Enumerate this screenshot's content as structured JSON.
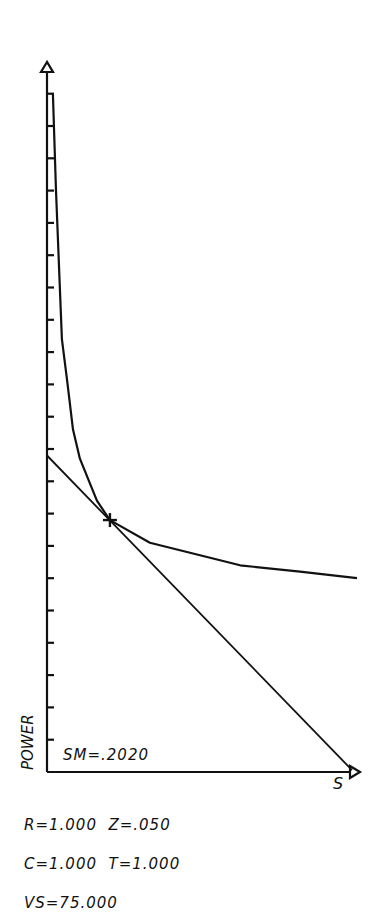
{
  "chart_data": {
    "type": "line",
    "title": "",
    "xlabel": "S",
    "ylabel": "POWER",
    "xlim": [
      0,
      1.0
    ],
    "ylim": [
      0,
      21
    ],
    "grid": false,
    "y_ticks_count": 21,
    "series": [
      {
        "name": "power-curve",
        "x": [
          0.019,
          0.029,
          0.048,
          0.065,
          0.084,
          0.106,
          0.161,
          0.203,
          0.332,
          0.623,
          0.816,
          1.0
        ],
        "y": [
          21.0,
          18.0,
          13.4,
          12.1,
          10.6,
          9.7,
          8.4,
          7.8,
          7.1,
          6.4,
          6.2,
          6.0
        ]
      },
      {
        "name": "tangent-line",
        "x": [
          0.0,
          0.984
        ],
        "y": [
          9.8,
          0.06
        ]
      }
    ],
    "annotations": [
      {
        "type": "marker",
        "shape": "cross",
        "x": 0.203,
        "y": 7.8,
        "label": "tangent point"
      },
      {
        "type": "text",
        "text": "SM=.2020"
      }
    ]
  },
  "labels": {
    "y_axis": "POWER",
    "x_axis": "S",
    "sm": "SM=.2020"
  },
  "params": {
    "line1": "R=1.000  Z=.050",
    "line2": "C=1.000  T=1.000",
    "line3": "VS=75.000"
  }
}
